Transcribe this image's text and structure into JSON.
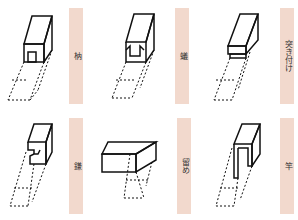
{
  "joints": [
    {
      "label": "枘",
      "reading": "hozo (tenon)"
    },
    {
      "label": "蟻",
      "reading": "ari (dovetail)"
    },
    {
      "label": "突き付け",
      "reading": "tsukitsuke (butt)"
    },
    {
      "label": "鎌",
      "reading": "kama (gooseneck)"
    },
    {
      "label": "留め",
      "reading": "tome (miter)"
    },
    {
      "label": "竿",
      "reading": "sao (rod)"
    }
  ],
  "colors": {
    "label_bar": "#f2d9cd",
    "line": "#111111"
  }
}
